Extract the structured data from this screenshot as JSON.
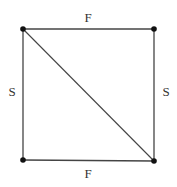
{
  "diagram": {
    "type": "square-with-diagonal",
    "vertices": [
      {
        "id": "TL",
        "x": 23,
        "y": 29
      },
      {
        "id": "TR",
        "x": 154,
        "y": 29
      },
      {
        "id": "BL",
        "x": 23,
        "y": 160
      },
      {
        "id": "BR",
        "x": 154,
        "y": 161
      }
    ],
    "edges": [
      {
        "from": "TL",
        "to": "TR",
        "label": "F"
      },
      {
        "from": "BL",
        "to": "BR",
        "label": "F"
      },
      {
        "from": "TL",
        "to": "BL",
        "label": "S"
      },
      {
        "from": "TR",
        "to": "BR",
        "label": "S"
      },
      {
        "from": "TL",
        "to": "BR",
        "label": ""
      }
    ],
    "labels": {
      "top": "F",
      "bottom": "F",
      "left": "S",
      "right": "S"
    },
    "colors": {
      "line": "#444444",
      "vertex": "#111111",
      "text": "#333333"
    }
  }
}
